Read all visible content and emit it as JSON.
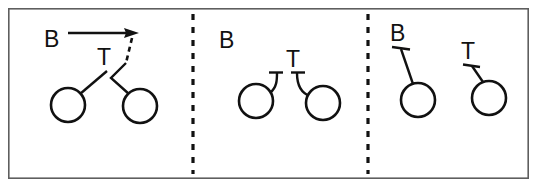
{
  "figure": {
    "width": 537,
    "height": 187,
    "background_color": "#ffffff",
    "ink_color": "#111111",
    "frame_color": "#5e5e5e",
    "panel_count": 3,
    "divider_style": "vertical dashed line"
  },
  "labels": {
    "b": "B",
    "t": "T"
  },
  "panels": [
    {
      "id": "panel-1",
      "name": "binding-approach",
      "b_label": "B",
      "t_label": "T",
      "b_label_x": 44,
      "b_label_y": 47,
      "t_label_x": 97,
      "t_label_y": 65,
      "arrow": {
        "x1": 68,
        "y1": 33,
        "x2": 128,
        "y2": 33
      },
      "dashed_segment": {
        "x1": 130,
        "y1": 36,
        "x2": 124,
        "y2": 64
      },
      "circles": [
        {
          "cx": 68,
          "cy": 105,
          "r": 17
        },
        {
          "cx": 140,
          "cy": 106,
          "r": 17
        }
      ],
      "connectors": [
        {
          "type": "line",
          "x1": 81,
          "y1": 93,
          "x2": 107,
          "y2": 71
        },
        {
          "type": "polyline",
          "points": "124,64 110,78 128,94"
        }
      ]
    },
    {
      "id": "panel-2",
      "name": "bound-state",
      "b_label": "B",
      "t_label": "T",
      "b_label_x": 219,
      "b_label_y": 48,
      "t_label_x": 286,
      "t_label_y": 67,
      "circles": [
        {
          "cx": 256,
          "cy": 101,
          "r": 17
        },
        {
          "cx": 323,
          "cy": 103,
          "r": 17
        }
      ],
      "connectors": [
        {
          "type": "curve",
          "d": "M 270 92 C 275 86 276 80 276 73"
        },
        {
          "type": "curve",
          "d": "M 309 95 C 302 92 298 84 298 73"
        }
      ],
      "caps": [
        {
          "x1": 270,
          "y1": 72,
          "x2": 282,
          "y2": 72
        },
        {
          "x1": 292,
          "y1": 72,
          "x2": 304,
          "y2": 72
        }
      ]
    },
    {
      "id": "panel-3",
      "name": "separated-state",
      "b_label": "B",
      "t_label": "T",
      "b_label_x": 390,
      "b_label_y": 41,
      "t_label_x": 461,
      "t_label_y": 59,
      "circles": [
        {
          "cx": 418,
          "cy": 100,
          "r": 17
        },
        {
          "cx": 489,
          "cy": 98,
          "r": 17
        }
      ],
      "connectors": [
        {
          "type": "line",
          "x1": 411,
          "y1": 83,
          "x2": 400,
          "y2": 48
        },
        {
          "type": "line",
          "x1": 482,
          "y1": 81,
          "x2": 471,
          "y2": 66
        }
      ],
      "caps": [
        {
          "x1": 392,
          "y1": 47,
          "x2": 410,
          "y2": 49
        },
        {
          "x1": 463,
          "y1": 65,
          "x2": 480,
          "y2": 67
        }
      ]
    }
  ],
  "dividers": [
    {
      "x": 193,
      "y1": 14,
      "y2": 174
    },
    {
      "x": 368,
      "y1": 14,
      "y2": 174
    }
  ],
  "frame": {
    "x": 8,
    "y": 8,
    "width": 521,
    "height": 171
  }
}
